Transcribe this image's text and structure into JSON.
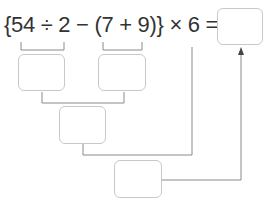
{
  "expression": {
    "text": "{54 ÷ 2 − (7 + 9)} × 6 =",
    "parts": [
      "{54",
      "÷",
      "2",
      "−",
      "(7 + 9)}",
      "×",
      "6",
      "="
    ]
  },
  "boxes": {
    "answer": "",
    "step_54_div_2": "",
    "step_7_plus_9": "",
    "step_difference": "",
    "step_times_6": ""
  },
  "colors": {
    "text": "#333333",
    "line": "#8a8a8a",
    "box_border": "#c8c8c8"
  }
}
